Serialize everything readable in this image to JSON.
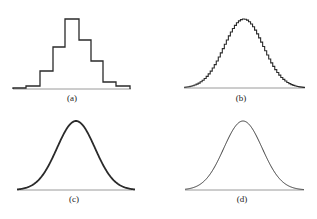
{
  "figure": {
    "panels": [
      {
        "id": "a",
        "label": "(a)",
        "kind": "histogram",
        "bins": 9,
        "x_range": [
          13,
          131
        ],
        "baseline_y": 89,
        "bin_edges": [
          13,
          26,
          40,
          53,
          65,
          79,
          91,
          103,
          116,
          130
        ],
        "bin_tops": [
          88,
          86,
          71,
          47,
          19,
          40,
          61,
          82,
          86
        ],
        "relative_heights": [
          0.01,
          0.04,
          0.26,
          0.6,
          1.0,
          0.7,
          0.4,
          0.1,
          0.04
        ]
      },
      {
        "id": "b",
        "label": "(b)",
        "kind": "fine-histogram",
        "bins": 60,
        "x_range": [
          184,
          305
        ],
        "baseline_y": 88,
        "peak": [
          244,
          19
        ]
      },
      {
        "id": "c",
        "label": "(c)",
        "kind": "smooth-curve-thick",
        "x_range": [
          17,
          135
        ],
        "baseline_y": 190,
        "peak": [
          76,
          121
        ]
      },
      {
        "id": "d",
        "label": "(d)",
        "kind": "smooth-curve-thin",
        "x_range": [
          185,
          304
        ],
        "baseline_y": 190,
        "peak": [
          243,
          121
        ]
      }
    ],
    "colors": {
      "curve": "#2a2a2a",
      "axis": "#9a9a9a",
      "text": "#222222"
    }
  },
  "chart_data": [
    {
      "type": "bar",
      "title": "(a)",
      "categories": [
        "1",
        "2",
        "3",
        "4",
        "5",
        "6",
        "7",
        "8",
        "9"
      ],
      "values": [
        0.01,
        0.04,
        0.26,
        0.6,
        1.0,
        0.7,
        0.4,
        0.1,
        0.04
      ],
      "xlabel": "",
      "ylabel": ""
    },
    {
      "type": "bar",
      "title": "(b)",
      "description": "~60-bin histogram approximating a normal curve"
    },
    {
      "type": "line",
      "title": "(c)",
      "description": "normal (bell) curve, thick stroke"
    },
    {
      "type": "line",
      "title": "(d)",
      "description": "normal (bell) curve, thin stroke"
    }
  ]
}
